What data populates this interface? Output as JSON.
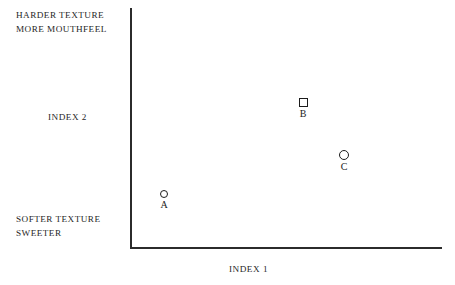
{
  "chart_data": {
    "type": "scatter",
    "title": "",
    "xlabel": "INDEX 1",
    "ylabel": "INDEX 2",
    "grid": false,
    "legend": "none",
    "axis_style": "open-left-bottom-spines",
    "xlim": [
      0,
      100
    ],
    "ylim": [
      0,
      100
    ],
    "axis_ticks": "none",
    "annotations": {
      "top_left_line1": "HARDER  TEXTURE",
      "top_left_line2": "MORE MOUTHFEEL",
      "bottom_left_line1": "SOFTER TEXTURE",
      "bottom_left_line2": "SWEETER"
    },
    "points": [
      {
        "label": "A",
        "x": 11.0,
        "y": 22.5,
        "marker": "open-circle",
        "marker_px": 8,
        "color": "#1c1c1c",
        "left_px": 164,
        "top_px": 190
      },
      {
        "label": "B",
        "x": 55.5,
        "y": 60.5,
        "marker": "open-square",
        "marker_px": 9,
        "color": "#1c1c1c",
        "left_px": 303,
        "top_px": 98
      },
      {
        "label": "C",
        "x": 68.5,
        "y": 38.5,
        "marker": "open-circle",
        "marker_px": 10,
        "color": "#1c1c1c",
        "left_px": 344,
        "top_px": 150
      }
    ]
  },
  "colors": {
    "axis": "#2b2b2b",
    "text": "#1f1f1f",
    "marker": "#1c1c1c",
    "background": "#ffffff"
  }
}
